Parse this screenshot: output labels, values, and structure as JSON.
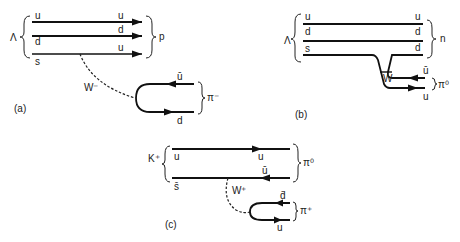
{
  "panels": {
    "a": {
      "caption": "(a)",
      "initial_particle": "Λ",
      "final_baryon": "p",
      "final_meson": "π⁻",
      "boson": "W⁻",
      "quarks_in": [
        "u",
        "d",
        "s"
      ],
      "quarks_out": [
        "u",
        "d",
        "u"
      ],
      "pair_top": "ū",
      "pair_bottom": "d"
    },
    "b": {
      "caption": "(b)",
      "initial_particle": "Λ",
      "final_baryon": "n",
      "final_meson": "π⁰",
      "boson": "W",
      "quarks_in": [
        "u",
        "d",
        "s"
      ],
      "quarks_out": [
        "u",
        "d",
        "d"
      ],
      "pair_top": "ū",
      "pair_bottom": "u"
    },
    "c": {
      "caption": "(c)",
      "initial_particle": "K⁺",
      "final_meson_1": "π⁰",
      "final_meson_2": "π⁺",
      "boson": "W⁺",
      "quarks_in": [
        "u",
        "s̄"
      ],
      "quarks_out": [
        "u",
        "ū"
      ],
      "pair_top": "d̄",
      "pair_bottom": "u"
    }
  }
}
